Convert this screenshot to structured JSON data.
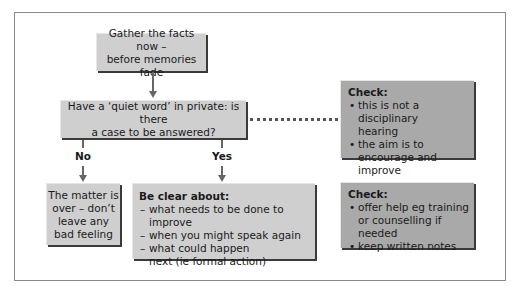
{
  "flowchart": {
    "start_box": {
      "text_line1": "Gather the facts now –",
      "text_line2": "before memories fade"
    },
    "decision_box": {
      "text_line1": "Have a ‘quiet word’ in private: is there",
      "text_line2": "a case to be answered?"
    },
    "branches": {
      "no_label": "No",
      "yes_label": "Yes"
    },
    "no_box": {
      "lines": [
        "The matter is",
        "over – don’t",
        "leave any",
        "bad feeling"
      ]
    },
    "yes_box": {
      "title": "Be clear about:",
      "items": [
        "what needs to be done to improve",
        "when you might speak again",
        "what could happen next (ie formal action)"
      ]
    },
    "check_box_1": {
      "title": "Check:",
      "items": [
        "this is not a disciplinary hearing",
        "the aim is to encourage and improve"
      ]
    },
    "check_box_2": {
      "title": "Check:",
      "items": [
        "offer help eg training or counselling if needed",
        "keep written notes"
      ]
    }
  },
  "colors": {
    "light_box": "#cfcfcf",
    "dark_box": "#a9a9a9",
    "connector": "#666666",
    "frame": "#8a8a8a"
  }
}
